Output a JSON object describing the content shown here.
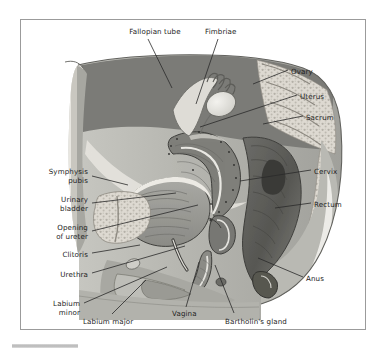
{
  "figure": {
    "kind": "anatomical-illustration",
    "title_visible": false,
    "view": "female pelvis midsagittal section",
    "palette": {
      "page_background": "#ffffff",
      "frame_border": "#9b9b9b",
      "label_text": "#1d1d1d",
      "leader_line": "#2a2a2a",
      "skin_outline": "#6f6f6f",
      "muscle_mid_gray": "#8d8d8d",
      "muscle_dark_gray": "#6a6a6a",
      "bone_light": "#d9d6cf",
      "cavity_pale": "#efefe9",
      "organ_dark": "#5c5c5c",
      "highlight_white": "#f7f7f4"
    }
  },
  "labels": [
    {
      "id": "fallopian-tube",
      "text": "Fallopian tube",
      "align": "center",
      "x": 118,
      "y": 28,
      "w": 74
    },
    {
      "id": "fimbriae",
      "text": "Fimbriae",
      "align": "left",
      "x": 205,
      "y": 28,
      "w": 56
    },
    {
      "id": "ovary",
      "text": "Ovary",
      "align": "left",
      "x": 291,
      "y": 68,
      "w": 46
    },
    {
      "id": "uterus",
      "text": "Uterus",
      "align": "left",
      "x": 300,
      "y": 93,
      "w": 46
    },
    {
      "id": "sacrum",
      "text": "Sacrum",
      "align": "left",
      "x": 306,
      "y": 114,
      "w": 48
    },
    {
      "id": "cervix",
      "text": "Cervix",
      "align": "left",
      "x": 314,
      "y": 168,
      "w": 44
    },
    {
      "id": "rectum",
      "text": "Rectum",
      "align": "left",
      "x": 314,
      "y": 201,
      "w": 48
    },
    {
      "id": "anus",
      "text": "Anus",
      "align": "left",
      "x": 306,
      "y": 275,
      "w": 40
    },
    {
      "id": "symphysis-pubis",
      "text": "Symphysis\npubis",
      "align": "right",
      "x": 24,
      "y": 168,
      "w": 64
    },
    {
      "id": "urinary-bladder",
      "text": "Urinary\nbladder",
      "align": "right",
      "x": 24,
      "y": 196,
      "w": 64
    },
    {
      "id": "opening-of-ureter",
      "text": "Opening\nof ureter",
      "align": "right",
      "x": 22,
      "y": 224,
      "w": 66
    },
    {
      "id": "clitoris",
      "text": "Clitoris",
      "align": "right",
      "x": 36,
      "y": 251,
      "w": 52
    },
    {
      "id": "urethra",
      "text": "Urethra",
      "align": "right",
      "x": 36,
      "y": 271,
      "w": 52
    },
    {
      "id": "labium-minor",
      "text": "Labium\nminor",
      "align": "right",
      "x": 28,
      "y": 300,
      "w": 52
    },
    {
      "id": "labium-major",
      "text": "Labium major",
      "align": "left",
      "x": 83,
      "y": 318,
      "w": 72
    },
    {
      "id": "vagina",
      "text": "Vagina",
      "align": "left",
      "x": 172,
      "y": 310,
      "w": 44
    },
    {
      "id": "bartholins-gland",
      "text": "Bartholin's gland",
      "align": "left",
      "x": 225,
      "y": 318,
      "w": 90
    }
  ],
  "leaders": [
    {
      "id": "leader-fallopian-tube",
      "points": "148,39 172,88"
    },
    {
      "id": "leader-fimbriae",
      "points": "218,39 196,104"
    },
    {
      "id": "leader-ovary",
      "points": "288,70 253,84"
    },
    {
      "id": "leader-uterus",
      "points": "297,95 200,127"
    },
    {
      "id": "leader-sacrum",
      "points": "303,116 263,124"
    },
    {
      "id": "leader-cervix",
      "points": "311,170 240,181"
    },
    {
      "id": "leader-rectum",
      "points": "311,203 275,208"
    },
    {
      "id": "leader-anus",
      "points": "303,277 258,258"
    },
    {
      "id": "leader-symphysis-pubis",
      "points": "92,176 128,185"
    },
    {
      "id": "leader-urinary-bladder",
      "points": "92,203 176,193"
    },
    {
      "id": "leader-opening-of-ureter",
      "points": "92,231 198,205"
    },
    {
      "id": "leader-clitoris",
      "points": "92,253 140,245"
    },
    {
      "id": "leader-urethra",
      "points": "92,273 185,246"
    },
    {
      "id": "leader-labium-minor",
      "points": "84,303 167,267"
    },
    {
      "id": "leader-labium-major",
      "points": "112,314 146,280"
    },
    {
      "id": "leader-vagina",
      "points": "186,307 199,262"
    },
    {
      "id": "leader-bartholins-gland",
      "points": "234,313 215,265"
    }
  ]
}
